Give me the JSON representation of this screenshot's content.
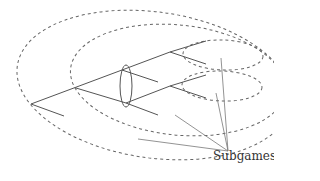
{
  "diagram": {
    "type": "game-tree",
    "label": "Subgames",
    "colors": {
      "tree": "#555555",
      "subgame_outline": "#666666",
      "pointer": "#777777",
      "label": "#333333"
    },
    "elements": {
      "root": "root node with two branches",
      "information_set": "ellipse grouping two decision nodes",
      "subgames": 4,
      "pointers": 4
    }
  }
}
